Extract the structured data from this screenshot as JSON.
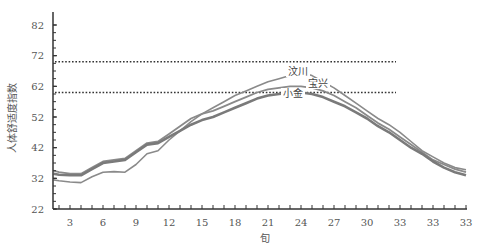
{
  "chart_data": {
    "type": "line",
    "title": "",
    "xlabel": "旬",
    "ylabel": "人体舒适度指数",
    "ylim": [
      22,
      82
    ],
    "yticks": [
      22,
      32,
      42,
      52,
      62,
      72,
      82
    ],
    "xlim": [
      1.5,
      39
    ],
    "xtick_positions": [
      3,
      6,
      9,
      12,
      15,
      18,
      21,
      24,
      27,
      30,
      33,
      36,
      39
    ],
    "xtick_labels": [
      "3",
      "6",
      "9",
      "12",
      "15",
      "18",
      "21",
      "24",
      "27",
      "30",
      "33",
      "33",
      "33"
    ],
    "grid": false,
    "reference_lines": [
      {
        "y": 70,
        "style": "dotted"
      },
      {
        "y": 60,
        "style": "dotted"
      }
    ],
    "x": [
      1.5,
      2,
      3,
      4,
      5,
      6,
      7,
      8,
      9,
      10,
      11,
      12,
      13,
      14,
      15,
      16,
      17,
      18,
      19,
      20,
      21,
      22,
      23,
      24,
      25,
      26,
      27,
      28,
      29,
      30,
      31,
      32,
      33,
      34,
      35,
      36,
      37,
      38,
      39
    ],
    "series": [
      {
        "name": "汶川",
        "values": [
          31.5,
          31.2,
          30.8,
          30.6,
          32.5,
          34.0,
          34.2,
          34.0,
          36.5,
          40.0,
          41.0,
          44.5,
          47.5,
          50.5,
          53.0,
          55.0,
          57.0,
          59.0,
          60.5,
          62.0,
          63.5,
          64.5,
          65.5,
          66.5,
          65.5,
          63.5,
          61.5,
          59.0,
          56.5,
          54.0,
          51.5,
          49.5,
          47.0,
          44.0,
          41.0,
          39.0,
          37.0,
          35.5,
          34.8
        ],
        "label_position": "peak"
      },
      {
        "name": "宝兴",
        "values": [
          34.5,
          34.0,
          33.5,
          33.5,
          35.5,
          37.5,
          38.0,
          38.5,
          41.0,
          43.5,
          44.0,
          46.5,
          49.0,
          51.5,
          53.0,
          54.0,
          55.5,
          57.0,
          58.5,
          60.0,
          61.0,
          61.5,
          62.0,
          62.0,
          61.5,
          60.5,
          59.0,
          57.0,
          55.0,
          52.5,
          50.0,
          48.0,
          45.5,
          43.0,
          40.5,
          38.0,
          36.5,
          35.0,
          34.0
        ],
        "label_position": "peak"
      },
      {
        "name": "小金",
        "values": [
          33.5,
          33.2,
          33.0,
          33.0,
          35.0,
          37.0,
          37.5,
          38.0,
          40.5,
          43.0,
          43.5,
          45.5,
          47.5,
          49.5,
          51.0,
          52.0,
          53.5,
          55.0,
          56.5,
          58.0,
          59.0,
          59.5,
          60.0,
          60.0,
          59.5,
          58.5,
          57.0,
          55.5,
          53.5,
          51.5,
          49.0,
          47.0,
          44.5,
          42.0,
          40.0,
          37.5,
          35.5,
          34.0,
          33.0
        ],
        "label_position": "peak"
      }
    ],
    "series_colors": [
      "#8a8a8a",
      "#8a8a8a",
      "#7a7a7a"
    ]
  }
}
